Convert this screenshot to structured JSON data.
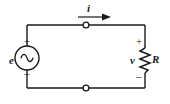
{
  "figure": {
    "background_color": "#ffffff",
    "line_color": "#1a1a1a"
  },
  "labels": {
    "current": "i",
    "source": "e",
    "voltage": "v",
    "resistor": "R",
    "source_plus": "+",
    "source_minus": "–",
    "resistor_plus": "+",
    "resistor_minus": "–"
  },
  "components": {
    "source": {
      "name": "ac-voltage-source",
      "symbol": "sine-wave",
      "shape": "circle"
    },
    "resistor": {
      "name": "resistor",
      "symbol": "zigzag"
    },
    "nodes": [
      {
        "name": "top-node",
        "x": 86,
        "y": 25
      },
      {
        "name": "bottom-node",
        "x": 86,
        "y": 88
      }
    ],
    "current_arrow": {
      "direction": "right",
      "x_start": 78,
      "x_end": 110,
      "y": 17
    }
  },
  "wires": {
    "left_x": 27,
    "right_x": 145,
    "top_y": 25,
    "bottom_y": 88
  }
}
